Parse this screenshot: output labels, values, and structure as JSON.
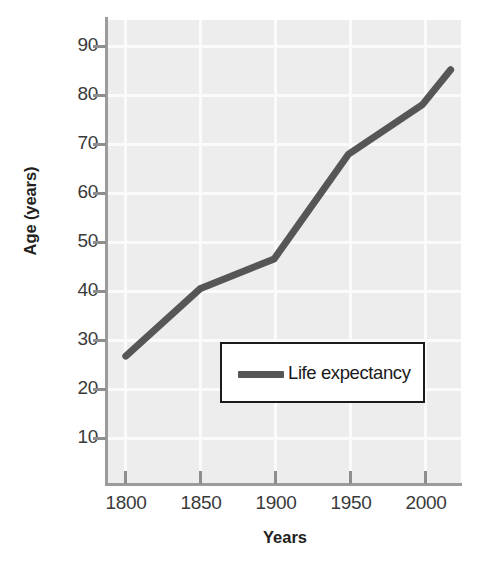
{
  "chart_data": {
    "type": "line",
    "title": "",
    "xlabel": "Years",
    "ylabel": "Age (years)",
    "xlim": [
      1788,
      2026
    ],
    "ylim": [
      2,
      95
    ],
    "grid": true,
    "legend_position": "center",
    "x_ticks": [
      "1800",
      "1850",
      "1900",
      "1950",
      "2000"
    ],
    "y_ticks": [
      "90",
      "80",
      "70",
      "60",
      "50",
      "40",
      "30",
      "20",
      "10"
    ],
    "series": [
      {
        "name": "Life expectancy",
        "color": "#565656",
        "x": [
          1800,
          1850,
          1900,
          1950,
          2000,
          2019
        ],
        "values": [
          27.5,
          41,
          47,
          68,
          78,
          85
        ]
      }
    ]
  },
  "legend": {
    "entries": [
      {
        "label": "Life expectancy",
        "color": "#565656"
      }
    ]
  },
  "axes": {
    "y_title": "Age (years)",
    "x_title": "Years"
  },
  "colors": {
    "plot_background": "#ededed",
    "gridline": "#fbfbfb",
    "axis": "#9b9b9b",
    "series": "#565656",
    "text": "#231f20",
    "legend_border": "#1b1b1b"
  }
}
